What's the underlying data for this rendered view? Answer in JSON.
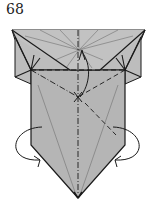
{
  "diagram": {
    "step_number": "68",
    "colors": {
      "paper": "#b8b8b8",
      "paper_light": "#c4c4c4",
      "line": "#1a1a1a",
      "crease": "#6a6a6a",
      "background": "#ffffff"
    },
    "symbols": {
      "valley_fold_lines": [
        "horizontal-valley-fold",
        "diagonal-valley-fold-right"
      ],
      "mountain_fold_lines": [
        "vertical-mountain-fold",
        "diagonal-mountain-fold-left"
      ],
      "arrows": [
        "fold-up-arrow",
        "left-wrap-arrow",
        "right-wrap-arrow"
      ]
    }
  }
}
